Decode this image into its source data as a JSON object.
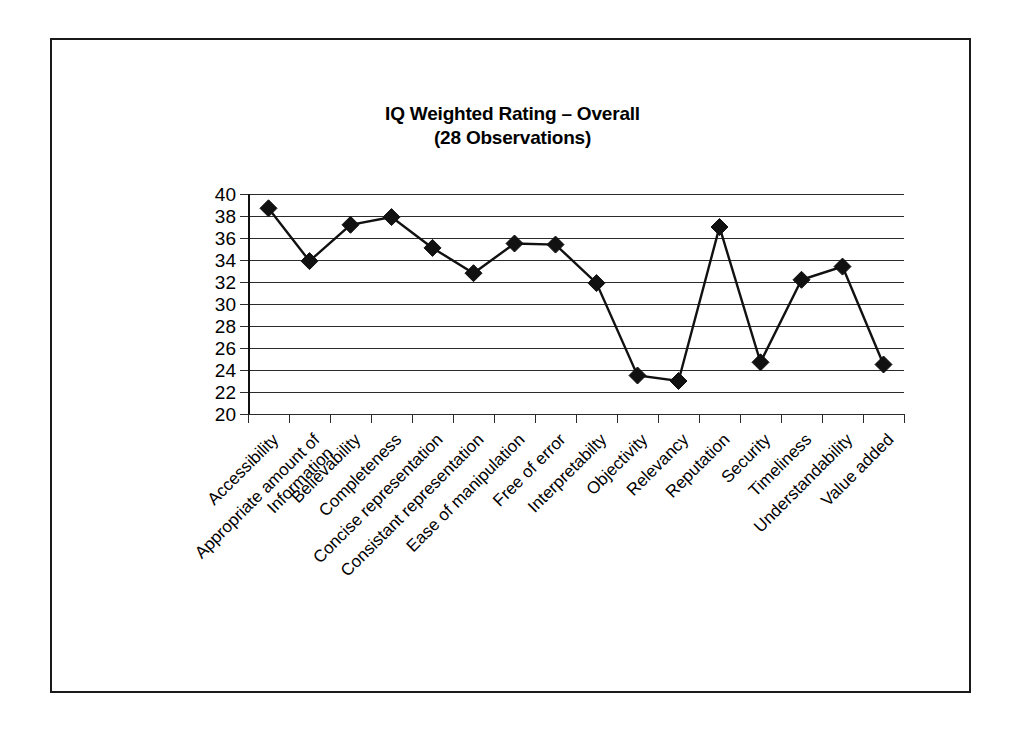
{
  "figure": {
    "title_line1": "IQ Weighted Rating – Overall",
    "title_line2": "(28 Observations)",
    "frame_color": "#1a1a1a",
    "background": "#ffffff"
  },
  "chart_data": {
    "type": "line",
    "title": "IQ Weighted Rating – Overall (28 Observations)",
    "subtitle": "(28 Observations)",
    "xlabel": "",
    "ylabel": "",
    "ylim": [
      20,
      40
    ],
    "yticks": [
      20,
      22,
      24,
      26,
      28,
      30,
      32,
      34,
      36,
      38,
      40
    ],
    "ytick_labels": [
      "20",
      "22",
      "24",
      "26",
      "28",
      "30",
      "32",
      "34",
      "36",
      "38",
      "40"
    ],
    "grid": true,
    "grid_axis": "y",
    "legend": false,
    "legend_position": "none",
    "marker": "diamond",
    "marker_color": "#111111",
    "line_color": "#111111",
    "categories": [
      "Accessibility",
      "Appropriate amount of Information",
      "Believability",
      "Completeness",
      "Concise representation",
      "Consistant representation",
      "Ease of manipulation",
      "Free of error",
      "Interpretabilty",
      "Objectivity",
      "Relevancy",
      "Reputation",
      "Security",
      "Timeliness",
      "Understandability",
      "Value added"
    ],
    "category_lines": [
      [
        "Accessibility"
      ],
      [
        "Appropriate amount of",
        "Information"
      ],
      [
        "Believability"
      ],
      [
        "Completeness"
      ],
      [
        "Concise representation"
      ],
      [
        "Consistant representation"
      ],
      [
        "Ease of manipulation"
      ],
      [
        "Free of error"
      ],
      [
        "Interpretabilty"
      ],
      [
        "Objectivity"
      ],
      [
        "Relevancy"
      ],
      [
        "Reputation"
      ],
      [
        "Security"
      ],
      [
        "Timeliness"
      ],
      [
        "Understandability"
      ],
      [
        "Value added"
      ]
    ],
    "values": [
      38.7,
      33.9,
      37.2,
      37.9,
      35.1,
      32.8,
      35.5,
      35.4,
      31.9,
      23.5,
      23.0,
      37.0,
      24.7,
      32.2,
      33.4,
      24.5
    ],
    "series": [
      {
        "name": "IQ Weighted Rating",
        "values": [
          38.7,
          33.9,
          37.2,
          37.9,
          35.1,
          32.8,
          35.5,
          35.4,
          31.9,
          23.5,
          23.0,
          37.0,
          24.7,
          32.2,
          33.4,
          24.5
        ]
      }
    ]
  }
}
